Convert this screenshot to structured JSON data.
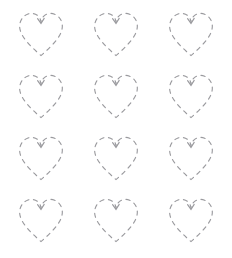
{
  "page": {
    "background_color": "#ffffff",
    "width": 232,
    "height": 258
  },
  "grid": {
    "columns": 3,
    "rows": 4,
    "total_shapes": 12,
    "shape_name": "heart"
  },
  "shape": {
    "name": "heart-outline",
    "icon": "heart-icon",
    "style": "dashed",
    "stroke_color": "#9a9a9e",
    "stroke_width": "1.15",
    "fill": "none",
    "dash_pattern": "4.2 4.6",
    "width_px": 50,
    "height_px": 48
  },
  "hearts": [
    {
      "index": 1,
      "row": 1,
      "column": 1,
      "label": "heart-r1-c1"
    },
    {
      "index": 2,
      "row": 1,
      "column": 2,
      "label": "heart-r1-c2"
    },
    {
      "index": 3,
      "row": 1,
      "column": 3,
      "label": "heart-r1-c3"
    },
    {
      "index": 4,
      "row": 2,
      "column": 1,
      "label": "heart-r2-c1"
    },
    {
      "index": 5,
      "row": 2,
      "column": 2,
      "label": "heart-r2-c2"
    },
    {
      "index": 6,
      "row": 2,
      "column": 3,
      "label": "heart-r2-c3"
    },
    {
      "index": 7,
      "row": 3,
      "column": 1,
      "label": "heart-r3-c1"
    },
    {
      "index": 8,
      "row": 3,
      "column": 2,
      "label": "heart-r3-c2"
    },
    {
      "index": 9,
      "row": 3,
      "column": 3,
      "label": "heart-r3-c3"
    },
    {
      "index": 10,
      "row": 4,
      "column": 1,
      "label": "heart-r4-c1"
    },
    {
      "index": 11,
      "row": 4,
      "column": 2,
      "label": "heart-r4-c2"
    },
    {
      "index": 12,
      "row": 4,
      "column": 3,
      "label": "heart-r4-c3"
    }
  ]
}
